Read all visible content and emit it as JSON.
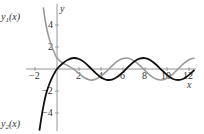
{
  "chart_data": {
    "type": "line",
    "title": "",
    "xlabel": "x",
    "ylabel": "y",
    "xlim": [
      -2.5,
      12.8
    ],
    "ylim": [
      -5.6,
      5.8
    ],
    "xticks": [
      -2,
      2,
      4,
      6,
      8,
      10,
      12
    ],
    "xtick_labels": [
      "−2",
      "2",
      "4",
      "6",
      "8",
      "10",
      "12"
    ],
    "yticks": [
      4,
      2,
      -2,
      -4
    ],
    "ytick_labels": [
      "4",
      "2",
      "−2",
      "−4"
    ],
    "grid": false,
    "legend": "none (curves labeled directly)",
    "series": [
      {
        "name": "y1(x)",
        "label": "y",
        "subscript": "1",
        "arg": "(x)",
        "color": "#9a9a9a",
        "description": "decays from large values at left, then oscillates with amplitude about 1 around 0",
        "x": [
          -1.25,
          -1.0,
          -0.75,
          -0.5,
          -0.25,
          0,
          0.5,
          1,
          1.5,
          2,
          2.5,
          3,
          3.5,
          4,
          4.5,
          5,
          5.5,
          6,
          6.5,
          7,
          7.5,
          8,
          8.5,
          9,
          9.5,
          10,
          10.5,
          11,
          11.5,
          12,
          12.5
        ],
        "y": [
          5.6,
          4.0,
          2.9,
          2.1,
          1.5,
          1.0,
          0.55,
          0.3,
          0.0,
          -0.4,
          -0.8,
          -1.0,
          -0.94,
          -0.65,
          -0.21,
          0.28,
          0.71,
          0.96,
          0.98,
          0.75,
          0.35,
          -0.15,
          -0.6,
          -0.91,
          -1.0,
          -0.84,
          -0.48,
          0.0,
          0.48,
          0.84,
          1.0
        ]
      },
      {
        "name": "y2(x)",
        "label": "y",
        "subscript": "2",
        "arg": "(x)",
        "color": "#111111",
        "description": "rises steeply from large negative values at left, then oscillates like sin x",
        "x": [
          -1.6,
          -1.4,
          -1.2,
          -1.0,
          -0.75,
          -0.5,
          -0.25,
          0,
          0.5,
          1,
          1.5,
          2,
          2.5,
          3,
          3.5,
          4,
          4.5,
          5,
          5.5,
          6,
          6.5,
          7,
          7.5,
          8,
          8.5,
          9,
          9.5,
          10,
          10.5,
          11,
          11.5,
          12,
          12.5
        ],
        "y": [
          -5.6,
          -4.3,
          -3.2,
          -2.3,
          -1.5,
          -0.9,
          -0.4,
          0.0,
          0.5,
          0.84,
          1.0,
          0.91,
          0.6,
          0.14,
          -0.35,
          -0.76,
          -0.98,
          -0.96,
          -0.71,
          -0.28,
          0.22,
          0.66,
          0.94,
          0.99,
          0.8,
          0.41,
          -0.08,
          -0.54,
          -0.88,
          -1.0,
          -0.88,
          -0.54,
          -0.07
        ]
      }
    ]
  },
  "labels": {
    "y_axis": "y",
    "x_axis": "x",
    "y1_main": "y",
    "y1_sub": "1",
    "y1_arg": "(x)",
    "y2_main": "y",
    "y2_sub": "2",
    "y2_arg": "(x)",
    "xt_m2": "−2",
    "xt_2": "2",
    "xt_4": "4",
    "xt_6": "6",
    "xt_8": "8",
    "xt_10": "10",
    "xt_12": "12",
    "yt_4": "4",
    "yt_2": "2",
    "yt_m2": "−2",
    "yt_m4": "−4"
  }
}
